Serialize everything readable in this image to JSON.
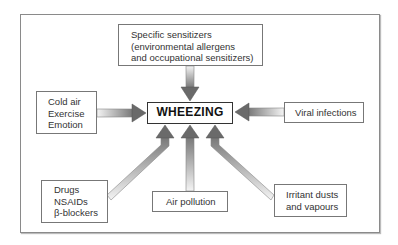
{
  "diagram": {
    "center": {
      "label": "WHEEZING"
    },
    "causes": {
      "specific_sensitizers": {
        "lines": [
          "Specific sensitizers",
          "(environmental allergens",
          "and occupational sensitizers)"
        ]
      },
      "physical": {
        "lines": [
          "Cold air",
          "Exercise",
          "Emotion"
        ]
      },
      "viral": {
        "lines": [
          "Viral infections"
        ]
      },
      "drugs": {
        "lines": [
          "Drugs",
          "NSAIDs",
          "β-blockers"
        ]
      },
      "air_pollution": {
        "lines": [
          "Air pollution"
        ]
      },
      "irritants": {
        "lines": [
          "Irritant dusts",
          "and vapours"
        ]
      }
    },
    "arrow_color": "#666666"
  }
}
